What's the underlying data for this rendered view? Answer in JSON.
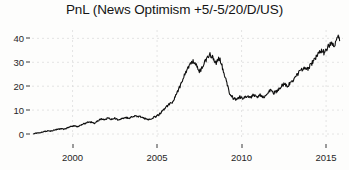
{
  "chart_data": {
    "type": "line",
    "title": "PnL (News Optimism +5/-5/20/D/US)",
    "xlabel": "",
    "ylabel": "",
    "xlim": [
      1997.6,
      1916.0
    ],
    "x_range": [
      1997.6,
      2016.0
    ],
    "ylim": [
      -2.5,
      43.5
    ],
    "xticks": [
      2000,
      2005,
      2010,
      2015
    ],
    "xtick_labels": [
      "2000",
      "2005",
      "2010",
      "2015"
    ],
    "yticks": [
      0,
      10,
      20,
      30,
      40
    ],
    "ytick_labels": [
      "0",
      "10",
      "20",
      "30",
      "40"
    ],
    "grid": true,
    "grid_style": "dotted",
    "grid_color": "#d8d8d8",
    "legend": null,
    "line_color": "#101010",
    "line_width": 1.1,
    "background": "#fdfdfc",
    "series": [
      {
        "name": "PnL",
        "x": [
          1997.7,
          1997.9,
          1998.1,
          1998.3,
          1998.5,
          1998.7,
          1998.9,
          1999.1,
          1999.3,
          1999.5,
          1999.7,
          1999.9,
          2000.1,
          2000.3,
          2000.5,
          2000.7,
          2000.9,
          2001.1,
          2001.3,
          2001.5,
          2001.7,
          2001.9,
          2002.1,
          2002.3,
          2002.5,
          2002.7,
          2002.9,
          2003.1,
          2003.3,
          2003.5,
          2003.7,
          2003.9,
          2004.1,
          2004.3,
          2004.5,
          2004.7,
          2004.9,
          2005.1,
          2005.3,
          2005.5,
          2005.7,
          2005.9,
          2006.1,
          2006.3,
          2006.5,
          2006.7,
          2006.9,
          2007.1,
          2007.3,
          2007.5,
          2007.7,
          2007.9,
          2008.1,
          2008.3,
          2008.5,
          2008.7,
          2008.9,
          2009.1,
          2009.3,
          2009.5,
          2009.7,
          2009.9,
          2010.1,
          2010.3,
          2010.5,
          2010.7,
          2010.9,
          2011.1,
          2011.3,
          2011.5,
          2011.7,
          2011.9,
          2012.1,
          2012.3,
          2012.5,
          2012.7,
          2012.9,
          2013.1,
          2013.3,
          2013.5,
          2013.7,
          2013.9,
          2014.1,
          2014.3,
          2014.5,
          2014.7,
          2014.9,
          2015.1,
          2015.3,
          2015.5,
          2015.7,
          2015.8
        ],
        "y": [
          0.2,
          0.4,
          0.6,
          1.0,
          1.3,
          1.2,
          1.6,
          2.0,
          2.2,
          2.0,
          2.6,
          3.2,
          3.4,
          3.0,
          3.6,
          4.4,
          4.8,
          5.0,
          4.4,
          5.6,
          6.4,
          6.0,
          6.8,
          6.2,
          6.6,
          6.0,
          6.4,
          7.0,
          6.6,
          7.2,
          7.6,
          7.4,
          7.0,
          6.4,
          6.0,
          6.6,
          7.2,
          8.0,
          9.5,
          11.0,
          12.5,
          13.0,
          16.0,
          19.0,
          22.5,
          26.0,
          28.5,
          30.5,
          29.0,
          26.0,
          28.0,
          31.0,
          33.5,
          32.0,
          29.5,
          32.0,
          27.0,
          22.0,
          17.0,
          15.0,
          14.5,
          15.5,
          14.8,
          15.8,
          15.0,
          16.5,
          15.5,
          16.2,
          15.4,
          17.0,
          18.5,
          17.2,
          18.0,
          19.5,
          21.0,
          20.0,
          21.5,
          23.0,
          25.0,
          26.5,
          28.0,
          27.0,
          29.0,
          31.0,
          33.0,
          35.0,
          34.0,
          36.5,
          38.5,
          37.5,
          41.0,
          39.0
        ]
      }
    ]
  },
  "title": {
    "text": "PnL (News Optimism +5/-5/20/D/US)"
  }
}
